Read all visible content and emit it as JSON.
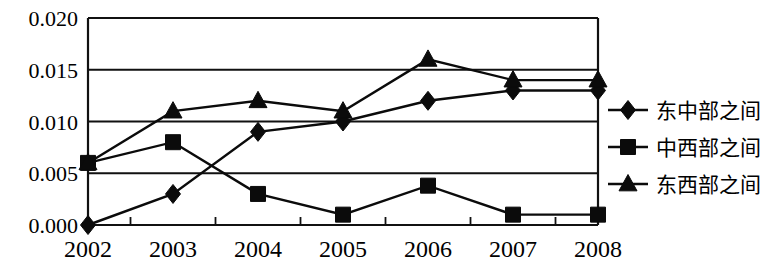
{
  "chart_data": {
    "type": "line",
    "title": "",
    "subtitle": "",
    "xlabel": "",
    "ylabel": "",
    "categories": [
      "2002",
      "2003",
      "2004",
      "2005",
      "2006",
      "2007",
      "2008"
    ],
    "x": [
      2002,
      2003,
      2004,
      2005,
      2006,
      2007,
      2008
    ],
    "ylim": [
      0.0,
      0.02
    ],
    "ytick_labels": [
      "0.020",
      "0.015",
      "0.010",
      "0.005",
      "0.000"
    ],
    "ytick_values": [
      0.02,
      0.015,
      0.01,
      0.005,
      0.0
    ],
    "grid": "horizontal",
    "legend_position": "right",
    "series": [
      {
        "name": "东中部之间",
        "marker": "diamond",
        "values": [
          0.0,
          0.003,
          0.009,
          0.01,
          0.012,
          0.013,
          0.013
        ]
      },
      {
        "name": "中西部之间",
        "marker": "square",
        "values": [
          0.006,
          0.008,
          0.003,
          0.001,
          0.0038,
          0.001,
          0.001
        ]
      },
      {
        "name": "东西部之间",
        "marker": "triangle",
        "values": [
          0.006,
          0.011,
          0.012,
          0.011,
          0.016,
          0.014,
          0.014
        ]
      }
    ]
  },
  "axis": {
    "y_labels": [
      "0.020",
      "0.015",
      "0.010",
      "0.005",
      "0.000"
    ],
    "x_labels": [
      "2002",
      "2003",
      "2004",
      "2005",
      "2006",
      "2007",
      "2008"
    ]
  },
  "legend": {
    "items": [
      {
        "label": "东中部之间",
        "marker": "diamond-marker-icon"
      },
      {
        "label": "中西部之间",
        "marker": "square-marker-icon"
      },
      {
        "label": "东西部之间",
        "marker": "triangle-marker-icon"
      }
    ]
  },
  "colors": {
    "ink": "#0b0b0b",
    "background": "#ffffff"
  }
}
